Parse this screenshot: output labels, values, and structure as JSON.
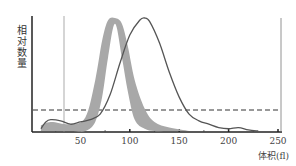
{
  "chart_data": {
    "type": "area",
    "title": "",
    "xlabel": "体积(fl)",
    "ylabel": "相对数量",
    "xlim": [
      0,
      255
    ],
    "x_ticks": [
      50,
      100,
      150,
      200,
      250
    ],
    "x_tick_labels": [
      "50",
      "100",
      "150",
      "200",
      "250"
    ],
    "grid": false,
    "legend": null,
    "reference_lines": [
      {
        "type": "vertical",
        "x": 33,
        "style": "solid-thin"
      },
      {
        "type": "horizontal",
        "y": 0.18,
        "style": "dashed"
      }
    ],
    "series": [
      {
        "name": "normal-range-band",
        "style": "gray-filled-band",
        "color": "#a8a8a8",
        "peak_x": 85,
        "x_range": [
          55,
          125
        ],
        "x": [
          10,
          20,
          40,
          55,
          65,
          72,
          78,
          85,
          92,
          98,
          105,
          115,
          125,
          140,
          160
        ],
        "lower": [
          0,
          0,
          0,
          0,
          0.08,
          0.3,
          0.65,
          0.95,
          0.65,
          0.35,
          0.1,
          0.02,
          0,
          0,
          0
        ],
        "upper": [
          0.05,
          0.08,
          0.06,
          0.12,
          0.45,
          0.8,
          0.98,
          1.0,
          0.95,
          0.75,
          0.45,
          0.2,
          0.08,
          0.03,
          0
        ]
      },
      {
        "name": "sample-curve",
        "style": "solid-line",
        "color": "#555555",
        "peak_x": 115,
        "x": [
          10,
          15,
          20,
          30,
          40,
          50,
          60,
          70,
          80,
          90,
          100,
          110,
          115,
          120,
          130,
          140,
          150,
          160,
          170,
          180,
          190,
          200,
          210,
          220,
          230
        ],
        "y": [
          0.02,
          0.08,
          0.1,
          0.09,
          0.06,
          0.08,
          0.1,
          0.15,
          0.32,
          0.6,
          0.85,
          0.98,
          1.0,
          0.97,
          0.78,
          0.52,
          0.3,
          0.15,
          0.09,
          0.06,
          0.03,
          0.02,
          0.03,
          0.01,
          0
        ]
      }
    ]
  }
}
